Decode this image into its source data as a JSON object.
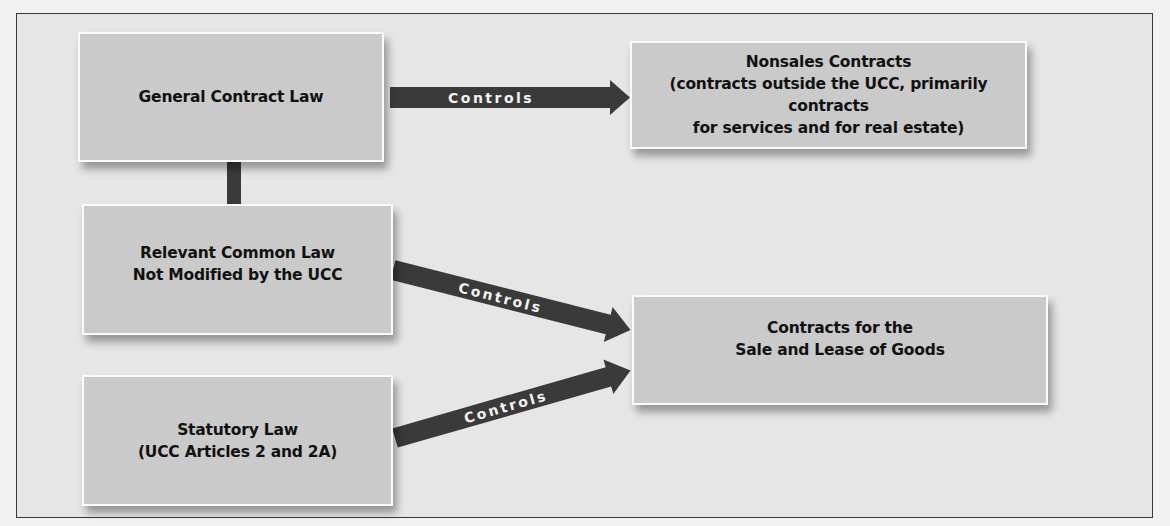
{
  "diagram": {
    "colors": {
      "background": "#e6e6e6",
      "box_fill": "#cacaca",
      "box_border": "#fbfbfb",
      "arrow": "#3a3a3a",
      "arrow_text": "#f4f4f4",
      "text": "#111111"
    },
    "nodes": {
      "general_contract_law": {
        "lines": [
          "General Contract Law"
        ]
      },
      "nonsales_contracts": {
        "lines": [
          "Nonsales Contracts",
          "(contracts outside the UCC, primarily contracts",
          "for services and for real estate)"
        ]
      },
      "relevant_common_law": {
        "lines": [
          "Relevant Common Law",
          "Not Modified by the UCC"
        ]
      },
      "statutory_law": {
        "lines": [
          "Statutory Law",
          "(UCC Articles 2 and 2A)"
        ]
      },
      "sale_lease_goods": {
        "lines": [
          "Contracts for the",
          "Sale and Lease of Goods"
        ]
      }
    },
    "edges": [
      {
        "from": "general_contract_law",
        "to": "nonsales_contracts",
        "label": "Controls"
      },
      {
        "from": "relevant_common_law",
        "to": "sale_lease_goods",
        "label": "Controls"
      },
      {
        "from": "statutory_law",
        "to": "sale_lease_goods",
        "label": "Controls"
      },
      {
        "from": "general_contract_law",
        "to": "relevant_common_law",
        "label": ""
      }
    ]
  }
}
